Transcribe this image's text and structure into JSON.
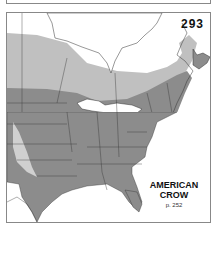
{
  "map": {
    "plate_number": "293",
    "species_name_line1": "AMERICAN",
    "species_name_line2": "CROW",
    "page_reference": "p. 252",
    "colors": {
      "year_round_range": "#8c8c8c",
      "summer_range": "#bdbdbd",
      "winter_range": "#d6d6d6",
      "land": "#ffffff",
      "border": "#333333"
    }
  }
}
